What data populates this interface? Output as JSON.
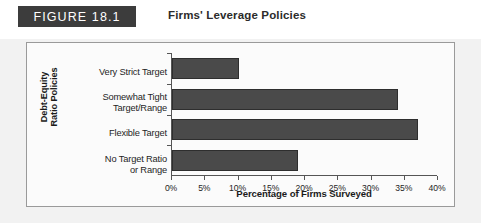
{
  "header": {
    "badge_label": "FIGURE 18.1",
    "title": "Firms' Leverage Policies"
  },
  "chart_data": {
    "type": "bar",
    "orientation": "horizontal",
    "title": "Firms' Leverage Policies",
    "categories": [
      "Very Strict Target",
      "Somewhat Tight Target/Range",
      "Flexible Target",
      "No Target Ratio or Range"
    ],
    "category_lines": [
      [
        "Very Strict Target"
      ],
      [
        "Somewhat Tight",
        "Target/Range"
      ],
      [
        "Flexible Target"
      ],
      [
        "No Target Ratio",
        "or Range"
      ]
    ],
    "values": [
      10,
      34,
      37,
      19
    ],
    "xlabel": "Percentage of Firms Surveyed",
    "ylabel_lines": [
      "Debt-Equity",
      "Ratio Policies"
    ],
    "xlim": [
      0,
      40
    ],
    "xticks": [
      0,
      5,
      10,
      15,
      20,
      25,
      30,
      35,
      40
    ],
    "xtick_labels": [
      "0%",
      "5%",
      "10%",
      "15%",
      "20%",
      "25%",
      "30%",
      "35%",
      "40%"
    ],
    "grid": false,
    "legend": "none",
    "bar_color": "#4a4a4a",
    "bar_edge_color": "#2e2e2e",
    "axis_color": "#555555"
  },
  "colors": {
    "badge_background": "#3c3c3c",
    "badge_text": "#ffffff",
    "panel_border": "#9a9a9a",
    "panel_background": "#fbfbfb",
    "page_background": "#f2f2f2"
  }
}
